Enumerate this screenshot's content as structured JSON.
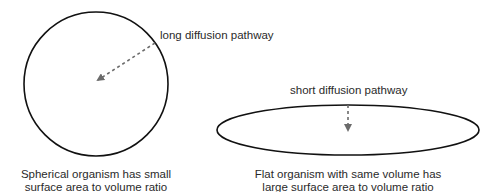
{
  "diagram": {
    "left": {
      "shape": "circle",
      "pathway_label": "long diffusion pathway",
      "caption_line1": "Spherical organism has small",
      "caption_line2": "surface area to volume ratio"
    },
    "right": {
      "shape": "ellipse",
      "pathway_label": "short diffusion pathway",
      "caption_line1": "Flat organism with same volume has",
      "caption_line2": "large surface area to volume ratio"
    },
    "colors": {
      "outline": "#111111",
      "arrow": "#6b6b6b",
      "text": "#2a2a2a",
      "background": "#ffffff"
    }
  }
}
